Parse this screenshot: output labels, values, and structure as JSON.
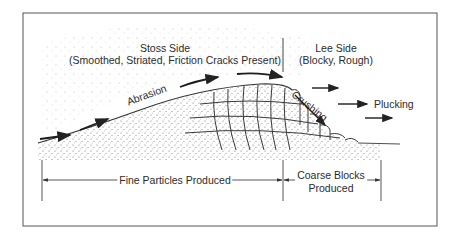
{
  "figure": {
    "stoss": {
      "heading": "Stoss Side",
      "description": "(Smoothed, Striated, Friction Cracks Present)"
    },
    "lee": {
      "heading": "Lee Side",
      "description": "(Blocky, Rough)"
    },
    "processes": {
      "abrasion": "Abrasion",
      "crushing": "Crushing",
      "plucking": "Plucking"
    },
    "products": {
      "fine": "Fine Particles Produced",
      "coarse_line1": "Coarse Blocks",
      "coarse_line2": "Produced"
    },
    "colors": {
      "ink": "#2b2b2b",
      "frame": "#555555",
      "stipple": "#6a6a6a",
      "background": "#ffffff"
    }
  }
}
